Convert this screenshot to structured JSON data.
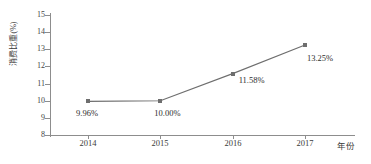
{
  "chart_data": {
    "type": "line",
    "title": "",
    "subtitle": "",
    "xlabel": "年份",
    "ylabel": "消费比重(%)",
    "categories": [
      "2014",
      "2015",
      "2016",
      "2017"
    ],
    "values": [
      9.96,
      10.0,
      11.58,
      13.25
    ],
    "point_labels": [
      "9.96%",
      "10.00%",
      "11.58%",
      "13.25%"
    ],
    "series": [
      {
        "name": "消费比重",
        "values": [
          9.96,
          10.0,
          11.58,
          13.25
        ]
      }
    ],
    "ylim": [
      8,
      15
    ],
    "yticks": [
      "15",
      "14",
      "13",
      "12",
      "11",
      "10",
      "9",
      "8"
    ],
    "ytick_values": [
      15,
      14,
      13,
      12,
      11,
      10,
      9,
      8
    ],
    "xticks": [
      "2014",
      "2015",
      "2016",
      "2017"
    ],
    "grid": false,
    "legend": false,
    "legend_position": "none",
    "marker_shape": "square",
    "colors": {
      "line": "#6e6e6e",
      "marker": "#6e6e6e",
      "axis": "#8d8d8d",
      "text": "#2e2e2e",
      "background": "#ffffff"
    }
  }
}
